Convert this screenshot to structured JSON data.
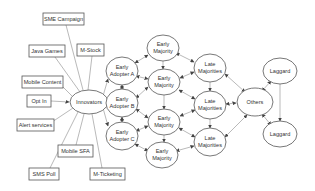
{
  "diagram": {
    "type": "innovation-diffusion-network",
    "colors": {
      "background": "#ffffff",
      "stroke": "#555555",
      "edge": "#8a8a8a",
      "text": "#333333"
    },
    "services": [
      {
        "id": "sme",
        "label": "SME Campaign"
      },
      {
        "id": "java",
        "label": "Java Games"
      },
      {
        "id": "mstock",
        "label": "M-Stock"
      },
      {
        "id": "mcontent",
        "label": "Mobile Content"
      },
      {
        "id": "optin",
        "label": "Opt  In"
      },
      {
        "id": "alert",
        "label": "Alert services"
      },
      {
        "id": "msfa",
        "label": "Mobile SFA"
      },
      {
        "id": "smspoll",
        "label": "SMS Poll"
      },
      {
        "id": "mticket",
        "label": "M-Ticketing"
      }
    ],
    "nodes": {
      "innovators": {
        "label": "Innovators"
      },
      "ea_a": {
        "line1": "Early",
        "line2": "Adopter A"
      },
      "ea_b": {
        "line1": "Early",
        "line2": "Adopter B"
      },
      "ea_c": {
        "line1": "Early",
        "line2": "Adopter C"
      },
      "em1": {
        "line1": "Early",
        "line2": "Majority"
      },
      "em2": {
        "line1": "Early",
        "line2": "Majority"
      },
      "em3": {
        "line1": "Early",
        "line2": "Majority"
      },
      "em4": {
        "line1": "Early",
        "line2": "Majority"
      },
      "lm1": {
        "line1": "Late",
        "line2": "Majorities"
      },
      "lm2": {
        "line1": "Late",
        "line2": "Majorities"
      },
      "lm3": {
        "line1": "Late",
        "line2": "Majorities"
      },
      "others": {
        "label": "Others"
      },
      "lag1": {
        "label": "Laggard"
      },
      "lag2": {
        "label": "Laggard"
      }
    },
    "edges": [
      [
        "innovators",
        "ea_a"
      ],
      [
        "innovators",
        "ea_b"
      ],
      [
        "innovators",
        "ea_c"
      ],
      [
        "ea_a",
        "em1"
      ],
      [
        "ea_a",
        "em2"
      ],
      [
        "ea_a",
        "ea_b"
      ],
      [
        "ea_b",
        "em2"
      ],
      [
        "ea_b",
        "em3"
      ],
      [
        "ea_b",
        "ea_c"
      ],
      [
        "ea_c",
        "em3"
      ],
      [
        "ea_c",
        "em4"
      ],
      [
        "em1",
        "em2"
      ],
      [
        "em1",
        "lm1"
      ],
      [
        "em2",
        "lm1"
      ],
      [
        "em2",
        "lm2"
      ],
      [
        "em2",
        "em3"
      ],
      [
        "em3",
        "lm2"
      ],
      [
        "em3",
        "lm3"
      ],
      [
        "em3",
        "em4"
      ],
      [
        "em4",
        "lm3"
      ],
      [
        "lm1",
        "lm2"
      ],
      [
        "lm2",
        "lm3"
      ],
      [
        "lm1",
        "others"
      ],
      [
        "lm2",
        "others"
      ],
      [
        "lm3",
        "others"
      ],
      [
        "others",
        "lag1"
      ],
      [
        "others",
        "lag2"
      ],
      [
        "lag1",
        "lag2"
      ]
    ]
  }
}
